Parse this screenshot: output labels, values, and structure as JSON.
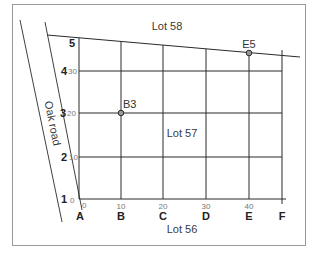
{
  "diagram": {
    "title": "",
    "lots": {
      "top": "Lot 58",
      "middle": "Lot 57",
      "bottom": "Lot 56"
    },
    "road_label": "Oak road",
    "columns": [
      {
        "letter": "A",
        "tick": "0"
      },
      {
        "letter": "B",
        "tick": "10"
      },
      {
        "letter": "C",
        "tick": "20"
      },
      {
        "letter": "D",
        "tick": "30"
      },
      {
        "letter": "E",
        "tick": "40"
      },
      {
        "letter": "F",
        "tick": ""
      }
    ],
    "rows": [
      {
        "number": "1",
        "tick": "0"
      },
      {
        "number": "2",
        "tick": "10"
      },
      {
        "number": "3",
        "tick": "20"
      },
      {
        "number": "4",
        "tick": "30"
      },
      {
        "number": "5",
        "tick": ""
      }
    ],
    "points": [
      {
        "label": "B3",
        "col": "B",
        "row": "3"
      },
      {
        "label": "E5",
        "col": "E",
        "row": "5"
      }
    ],
    "colors": {
      "line": "#2a2a2a",
      "border": "#999999",
      "background": "#ffffff"
    }
  }
}
